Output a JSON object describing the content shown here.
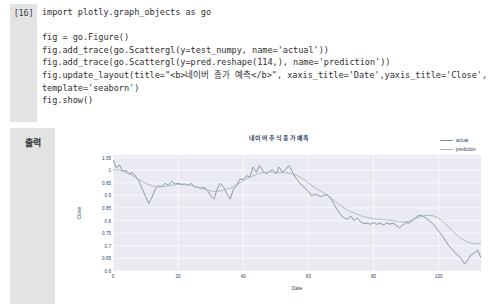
{
  "cell": {
    "execution_label": "[16]",
    "code_lines": [
      "import plotly.graph_objects as go",
      "",
      "fig = go.Figure()",
      "fig.add_trace(go.Scattergl(y=test_numpy, name='actual'))",
      "fig.add_trace(go.Scattergl(y=pred.reshape(114,), name='prediction'))",
      "fig.update_layout(title=\"<b>네이버 종가 예측</b>\", xaxis_title='Date',yaxis_title='Close',",
      "template='seaborn')",
      "fig.show()"
    ]
  },
  "output": {
    "label": "출력"
  },
  "colors": {
    "actual": "#7e8fa0",
    "prediction": "#a8b4bd",
    "plot_background": "#eaeaf2",
    "grid": "#ffffff",
    "tick_text": "#2a3f5f",
    "cell_gutter": "#e3e3e3"
  },
  "chart_data": {
    "type": "line",
    "title": "네이버 주식 종가 예측",
    "xlabel": "Date",
    "ylabel": "Close",
    "xlim": [
      0,
      113
    ],
    "ylim": [
      0.6,
      1.06
    ],
    "grid": true,
    "legend_position": "top-right",
    "xticks": [
      0,
      20,
      40,
      60,
      80,
      100
    ],
    "yticks": [
      0.6,
      0.65,
      0.7,
      0.75,
      0.8,
      0.85,
      0.9,
      0.95,
      1,
      1.05
    ],
    "ytick_labels": [
      "0.6",
      "0.65",
      "0.7",
      "0.75",
      "0.8",
      "0.85",
      "0.9",
      "0.95",
      "1",
      "1.05"
    ],
    "xtick_labels": [
      "0",
      "20",
      "40",
      "60",
      "80",
      "100"
    ],
    "x": [
      0,
      1,
      2,
      3,
      4,
      5,
      6,
      7,
      8,
      9,
      10,
      11,
      12,
      13,
      14,
      15,
      16,
      17,
      18,
      19,
      20,
      21,
      22,
      23,
      24,
      25,
      26,
      27,
      28,
      29,
      30,
      31,
      32,
      33,
      34,
      35,
      36,
      37,
      38,
      39,
      40,
      41,
      42,
      43,
      44,
      45,
      46,
      47,
      48,
      49,
      50,
      51,
      52,
      53,
      54,
      55,
      56,
      57,
      58,
      59,
      60,
      61,
      62,
      63,
      64,
      65,
      66,
      67,
      68,
      69,
      70,
      71,
      72,
      73,
      74,
      75,
      76,
      77,
      78,
      79,
      80,
      81,
      82,
      83,
      84,
      85,
      86,
      87,
      88,
      89,
      90,
      91,
      92,
      93,
      94,
      95,
      96,
      97,
      98,
      99,
      100,
      101,
      102,
      103,
      104,
      105,
      106,
      107,
      108,
      109,
      110,
      111,
      112,
      113
    ],
    "series": [
      {
        "name": "actual",
        "color": "#7e8fa0",
        "values": [
          1.04,
          1.01,
          1.02,
          0.995,
          1.0,
          0.985,
          0.99,
          0.975,
          0.955,
          0.925,
          0.895,
          0.868,
          0.893,
          0.925,
          0.938,
          0.935,
          0.948,
          0.94,
          0.955,
          0.945,
          0.948,
          0.942,
          0.945,
          0.94,
          0.947,
          0.935,
          0.932,
          0.928,
          0.932,
          0.92,
          0.898,
          0.885,
          0.925,
          0.948,
          0.932,
          0.905,
          0.885,
          0.925,
          0.94,
          0.965,
          0.962,
          0.978,
          0.972,
          1.012,
          0.992,
          1.018,
          0.998,
          0.985,
          0.995,
          1.002,
          0.985,
          1.012,
          0.992,
          1.002,
          1.018,
          0.995,
          0.972,
          0.955,
          0.94,
          0.928,
          0.915,
          0.898,
          0.905,
          0.9,
          0.895,
          0.902,
          0.9,
          0.885,
          0.862,
          0.84,
          0.822,
          0.81,
          0.805,
          0.818,
          0.8,
          0.81,
          0.795,
          0.788,
          0.79,
          0.785,
          0.792,
          0.785,
          0.79,
          0.782,
          0.79,
          0.786,
          0.79,
          0.78,
          0.772,
          0.782,
          0.792,
          0.79,
          0.802,
          0.812,
          0.822,
          0.818,
          0.812,
          0.8,
          0.79,
          0.775,
          0.758,
          0.742,
          0.722,
          0.702,
          0.688,
          0.672,
          0.662,
          0.648,
          0.628,
          0.645,
          0.665,
          0.672,
          0.682,
          0.652
        ]
      },
      {
        "name": "prediction",
        "color": "#a8b4bd",
        "values": [
          1.0,
          1.002,
          1.0,
          0.995,
          0.99,
          0.985,
          0.978,
          0.97,
          0.962,
          0.955,
          0.948,
          0.942,
          0.938,
          0.935,
          0.934,
          0.934,
          0.936,
          0.938,
          0.94,
          0.942,
          0.944,
          0.945,
          0.944,
          0.942,
          0.94,
          0.936,
          0.932,
          0.928,
          0.925,
          0.922,
          0.918,
          0.915,
          0.915,
          0.918,
          0.922,
          0.925,
          0.928,
          0.935,
          0.942,
          0.95,
          0.958,
          0.965,
          0.972,
          0.978,
          0.983,
          0.988,
          0.99,
          0.992,
          0.992,
          0.992,
          0.991,
          0.99,
          0.99,
          0.99,
          0.988,
          0.985,
          0.982,
          0.975,
          0.968,
          0.96,
          0.95,
          0.94,
          0.93,
          0.922,
          0.915,
          0.908,
          0.9,
          0.89,
          0.878,
          0.868,
          0.858,
          0.85,
          0.842,
          0.835,
          0.83,
          0.825,
          0.82,
          0.816,
          0.812,
          0.81,
          0.808,
          0.806,
          0.805,
          0.804,
          0.803,
          0.802,
          0.8,
          0.798,
          0.796,
          0.795,
          0.795,
          0.798,
          0.802,
          0.808,
          0.814,
          0.818,
          0.82,
          0.821,
          0.82,
          0.816,
          0.81,
          0.8,
          0.788,
          0.775,
          0.762,
          0.75,
          0.738,
          0.728,
          0.72,
          0.715,
          0.71,
          0.708,
          0.708,
          0.71
        ]
      }
    ]
  }
}
